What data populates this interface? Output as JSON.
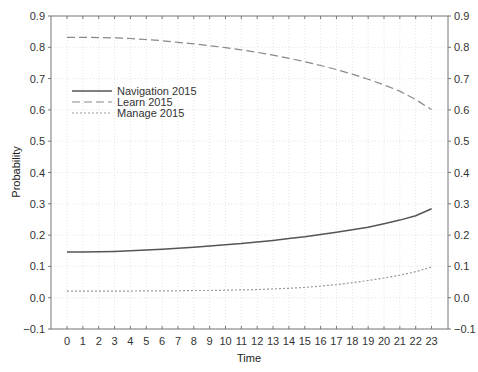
{
  "chart_data": {
    "type": "line",
    "title": "",
    "xlabel": "Time",
    "ylabel": "Probability",
    "x": [
      0,
      1,
      2,
      3,
      4,
      5,
      6,
      7,
      8,
      9,
      10,
      11,
      12,
      13,
      14,
      15,
      16,
      17,
      18,
      19,
      20,
      21,
      22,
      23
    ],
    "x_tick_labels": [
      "0",
      "1",
      "2",
      "3",
      "4",
      "5",
      "6",
      "7",
      "8",
      "9",
      "10",
      "11",
      "12",
      "13",
      "14",
      "15",
      "16",
      "17",
      "18",
      "19",
      "20",
      "21",
      "22",
      "23"
    ],
    "ylim": [
      -0.1,
      0.9
    ],
    "y_ticks": [
      -0.1,
      0.0,
      0.1,
      0.2,
      0.3,
      0.4,
      0.5,
      0.6,
      0.7,
      0.8,
      0.9
    ],
    "y_tick_labels": [
      "−0.1",
      "0.0",
      "0.1",
      "0.2",
      "0.3",
      "0.4",
      "0.5",
      "0.6",
      "0.7",
      "0.8",
      "0.9"
    ],
    "grid": true,
    "right_axis_mirrored": true,
    "legend_position": "upper-left",
    "series": [
      {
        "name": "Navigation 2015",
        "style": "solid",
        "color": "#555555",
        "values": [
          0.146,
          0.146,
          0.147,
          0.148,
          0.15,
          0.152,
          0.155,
          0.158,
          0.161,
          0.165,
          0.169,
          0.173,
          0.178,
          0.183,
          0.189,
          0.195,
          0.202,
          0.209,
          0.217,
          0.225,
          0.236,
          0.248,
          0.262,
          0.284
        ]
      },
      {
        "name": "Learn 2015",
        "style": "dashed",
        "color": "#888888",
        "values": [
          0.832,
          0.832,
          0.831,
          0.83,
          0.828,
          0.825,
          0.821,
          0.816,
          0.811,
          0.805,
          0.799,
          0.792,
          0.784,
          0.775,
          0.765,
          0.754,
          0.742,
          0.729,
          0.714,
          0.698,
          0.68,
          0.66,
          0.633,
          0.601
        ]
      },
      {
        "name": "Manage 2015",
        "style": "dotted",
        "color": "#999999",
        "values": [
          0.021,
          0.021,
          0.021,
          0.021,
          0.021,
          0.022,
          0.022,
          0.022,
          0.023,
          0.023,
          0.024,
          0.025,
          0.026,
          0.028,
          0.03,
          0.033,
          0.037,
          0.042,
          0.048,
          0.055,
          0.063,
          0.072,
          0.083,
          0.098
        ]
      }
    ]
  },
  "footer": {
    "text": "ESP 10.2"
  }
}
